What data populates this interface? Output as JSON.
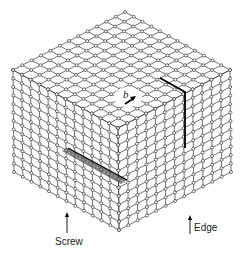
{
  "figure": {
    "grid_divisions": 12,
    "line_color": "#333333",
    "atom_fill": "#ffffff",
    "geometry": {
      "top": [
        122,
        10
      ],
      "left": [
        13,
        70
      ],
      "right": [
        230,
        70
      ],
      "front": [
        118,
        128
      ],
      "bottom_left": [
        13,
        180
      ],
      "bottom_right": [
        230,
        180
      ],
      "bottom": [
        119,
        230
      ]
    }
  },
  "labels": {
    "burgers_vector": "b",
    "screw": "Screw",
    "edge": "Edge"
  }
}
